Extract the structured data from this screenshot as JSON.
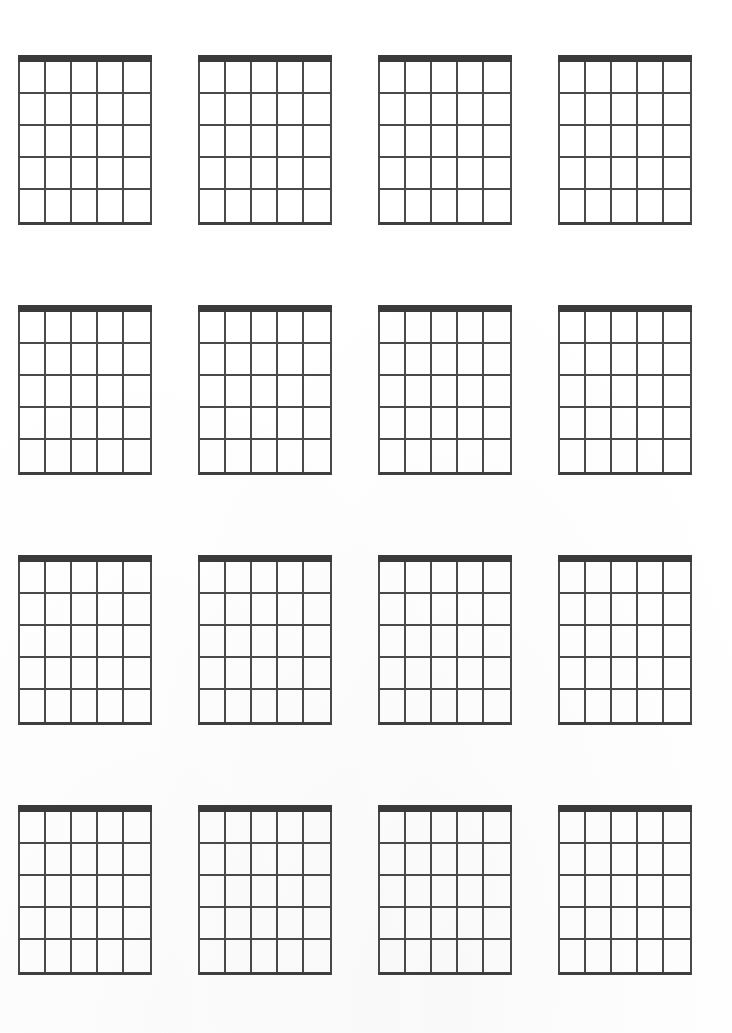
{
  "document": {
    "title": "Blank Guitar Chord Diagram Sheet",
    "type": "blank-chord-chart",
    "background_color": "#ffffff",
    "page_width": 732,
    "page_height": 1033
  },
  "style": {
    "nut_color": "#3a3a3a",
    "grid_line_color": "#4a4a4a",
    "bottom_line_color": "#3f3f3f"
  },
  "layout": {
    "columns": 4,
    "rows": 4,
    "total_diagrams": 16,
    "diagram_width": 134,
    "diagram_height": 170,
    "column_gap": 46,
    "row_gap": 80,
    "origin_x": 18,
    "origin_y": 55
  },
  "diagram_spec": {
    "strings": 6,
    "string_columns": 5,
    "frets": 5,
    "has_nut": true,
    "nut_thickness": 7,
    "labels": [],
    "markers": []
  },
  "diagrams": [
    {
      "index": 1,
      "row": 1,
      "col": 1,
      "name": "chord-diagram-1",
      "label": ""
    },
    {
      "index": 2,
      "row": 1,
      "col": 2,
      "name": "chord-diagram-2",
      "label": ""
    },
    {
      "index": 3,
      "row": 1,
      "col": 3,
      "name": "chord-diagram-3",
      "label": ""
    },
    {
      "index": 4,
      "row": 1,
      "col": 4,
      "name": "chord-diagram-4",
      "label": ""
    },
    {
      "index": 5,
      "row": 2,
      "col": 1,
      "name": "chord-diagram-5",
      "label": ""
    },
    {
      "index": 6,
      "row": 2,
      "col": 2,
      "name": "chord-diagram-6",
      "label": ""
    },
    {
      "index": 7,
      "row": 2,
      "col": 3,
      "name": "chord-diagram-7",
      "label": ""
    },
    {
      "index": 8,
      "row": 2,
      "col": 4,
      "name": "chord-diagram-8",
      "label": ""
    },
    {
      "index": 9,
      "row": 3,
      "col": 1,
      "name": "chord-diagram-9",
      "label": ""
    },
    {
      "index": 10,
      "row": 3,
      "col": 2,
      "name": "chord-diagram-10",
      "label": ""
    },
    {
      "index": 11,
      "row": 3,
      "col": 3,
      "name": "chord-diagram-11",
      "label": ""
    },
    {
      "index": 12,
      "row": 3,
      "col": 4,
      "name": "chord-diagram-12",
      "label": ""
    },
    {
      "index": 13,
      "row": 4,
      "col": 1,
      "name": "chord-diagram-13",
      "label": ""
    },
    {
      "index": 14,
      "row": 4,
      "col": 2,
      "name": "chord-diagram-14",
      "label": ""
    },
    {
      "index": 15,
      "row": 4,
      "col": 3,
      "name": "chord-diagram-15",
      "label": ""
    },
    {
      "index": 16,
      "row": 4,
      "col": 4,
      "name": "chord-diagram-16",
      "label": ""
    }
  ]
}
